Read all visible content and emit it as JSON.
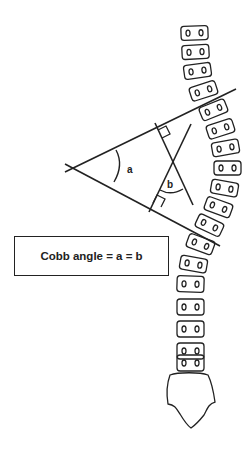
{
  "diagram": {
    "title_box": "Cobb angle = a = b",
    "labels": {
      "angle_a": "a",
      "angle_b": "b"
    },
    "components": [
      "spine-vertebrae",
      "sacrum",
      "upper-endplate-line",
      "lower-endplate-line",
      "upper-perpendicular",
      "lower-perpendicular",
      "angle-a-arc",
      "angle-b-arc"
    ],
    "vertebra_count": 19,
    "colors": {
      "stroke": "#222222",
      "background": "#ffffff"
    }
  }
}
